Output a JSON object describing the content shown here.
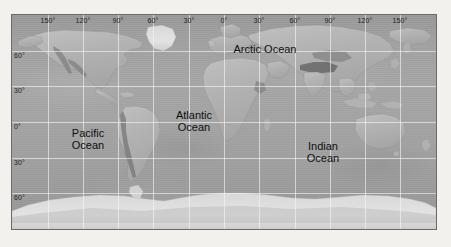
{
  "figure": {
    "kind": "world-relief-map",
    "projection": "equirectangular",
    "background_color": "#f2f1ee",
    "frame_border_color": "#6b6b6b",
    "ocean_color": "#a2a2a2",
    "land_color": "#b4b4b4",
    "graticule_color": "#f5f5f5",
    "label_color": "#101010"
  },
  "axes": {
    "longitude": {
      "unit_symbol": "°",
      "ticks": [
        {
          "label": "150°",
          "value": -150
        },
        {
          "label": "120°",
          "value": -120
        },
        {
          "label": "90°",
          "value": -90
        },
        {
          "label": "60°",
          "value": -60
        },
        {
          "label": "30°",
          "value": -30
        },
        {
          "label": "0°",
          "value": 0
        },
        {
          "label": "30°",
          "value": 30
        },
        {
          "label": "60°",
          "value": 60
        },
        {
          "label": "90°",
          "value": 90
        },
        {
          "label": "120°",
          "value": 120
        },
        {
          "label": "150°",
          "value": 150
        }
      ],
      "range": [
        -180,
        180
      ]
    },
    "latitude": {
      "unit_symbol": "°",
      "ticks": [
        {
          "label": "60°",
          "value": 60
        },
        {
          "label": "30°",
          "value": 30
        },
        {
          "label": "0°",
          "value": 0
        },
        {
          "label": "30°",
          "value": -30
        },
        {
          "label": "60°",
          "value": -60
        }
      ],
      "range": [
        -90,
        90
      ]
    }
  },
  "ocean_labels": [
    {
      "id": "arctic",
      "text": "Arctic Ocean"
    },
    {
      "id": "pacific",
      "text": "Pacific\nOcean"
    },
    {
      "id": "atlantic",
      "text": "Atlantic\nOcean"
    },
    {
      "id": "indian",
      "text": "Indian\nOcean"
    }
  ]
}
